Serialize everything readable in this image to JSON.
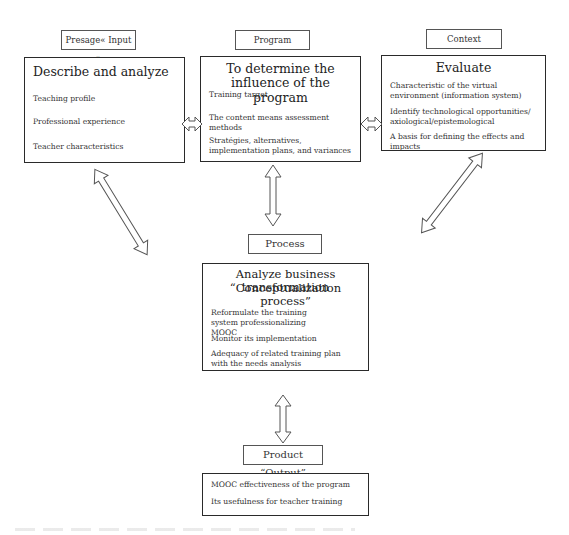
{
  "labels": {
    "input": "Presage« Input »",
    "program": "Program",
    "context": "Context",
    "process": "Process",
    "output": "Product “Output”"
  },
  "boxes": {
    "describe": {
      "title": "Describe and analyze",
      "items": [
        "Teaching profile",
        "Professional experience",
        "Teacher characteristics"
      ]
    },
    "program": {
      "title": "To determine the influence of the program",
      "items": [
        "Training target",
        "The content means assessment methods",
        "Stratégies, alternatives, implementation plans, and variances"
      ]
    },
    "evaluate": {
      "title": "Evaluate",
      "items": [
        "Characteristic of the virtual environment (information system)",
        "Identify technological opportunities/ axiological/epistemological",
        "A basis for defining the effects and impacts"
      ]
    },
    "process": {
      "title_line1": "Analyze business transformation",
      "title_line2": "“Conceptualization process”",
      "items": [
        "Reformulate the training system professionalizing MOOC",
        "Monitor its implementation",
        "Adequacy of related training plan with the needs analysis"
      ]
    },
    "output": {
      "items": [
        "MOOC effectiveness of the program",
        "Its usefulness for teacher training"
      ]
    }
  }
}
